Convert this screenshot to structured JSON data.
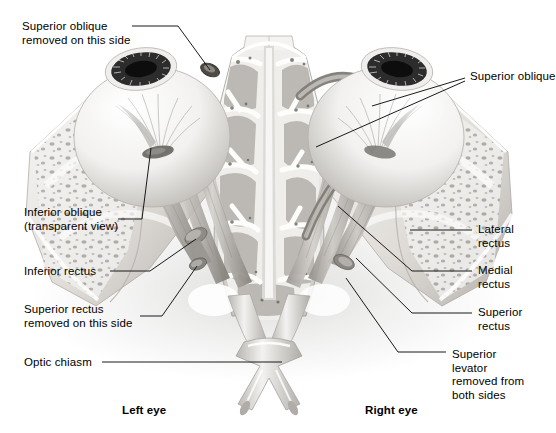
{
  "figure": {
    "background_color": "#ffffff",
    "ink_color": "#000000",
    "leader_color": "#1a1a1a",
    "palette": {
      "bone_light": "#f2f1ef",
      "bone_mid": "#cfcdc9",
      "bone_shadow": "#9e9b96",
      "muscle_light": "#d9d6d1",
      "muscle_mid": "#a9a5a0",
      "muscle_dark": "#6f6c68",
      "sclera": "#f6f5f3",
      "iris": "#3a3a3a",
      "pupil": "#111111",
      "nerve": "#e8e7e4"
    }
  },
  "labels": {
    "superior_oblique_removed": {
      "text": "Superior oblique\nremoved on this side",
      "x": 22,
      "y": 20
    },
    "inferior_oblique": {
      "text": "Inferior oblique\n(transparent view)",
      "x": 24,
      "y": 206
    },
    "inferior_rectus": {
      "text": "Inferior rectus",
      "x": 24,
      "y": 265
    },
    "superior_rectus_removed": {
      "text": "Superior rectus\nremoved on this side",
      "x": 24,
      "y": 303
    },
    "optic_chiasm": {
      "text": "Optic chiasm",
      "x": 24,
      "y": 356
    },
    "superior_oblique": {
      "text": "Superior oblique",
      "x": 470,
      "y": 70
    },
    "lateral_rectus": {
      "text": "Lateral\nrectus",
      "x": 478,
      "y": 223
    },
    "medial_rectus": {
      "text": "Medial\nrectus",
      "x": 478,
      "y": 264
    },
    "superior_rectus": {
      "text": "Superior\nrectus",
      "x": 478,
      "y": 306
    },
    "superior_levator": {
      "text": "Superior\nlevator\nremoved from\nboth sides",
      "x": 452,
      "y": 348
    },
    "left_eye": {
      "text": "Left eye",
      "x": 122,
      "y": 404
    },
    "right_eye": {
      "text": "Right eye",
      "x": 365,
      "y": 404
    }
  },
  "anatomy_parts": [
    "left-eyeball",
    "right-eyeball",
    "left-iris",
    "right-iris",
    "ethmoid-air-cells",
    "nasal-septum",
    "left-lateral-rectus",
    "left-medial-rectus",
    "left-inferior-rectus",
    "left-inferior-oblique",
    "right-superior-oblique",
    "right-lateral-rectus",
    "right-medial-rectus",
    "right-superior-rectus",
    "optic-nerve-left",
    "optic-nerve-right",
    "optic-chiasm",
    "trochlea-stump-left",
    "cut-muscle-stump-left",
    "cut-muscle-stump-right",
    "orbital-bone-left",
    "orbital-bone-right"
  ],
  "leader_lines": [
    {
      "name": "leader-superior-oblique-removed",
      "points": "132,26 178,26 210,70"
    },
    {
      "name": "leader-inferior-oblique",
      "points": "118,219 140,219 150,146"
    },
    {
      "name": "leader-inferior-rectus",
      "points": "110,271 148,271 196,239"
    },
    {
      "name": "leader-superior-rectus-removed",
      "points": "140,316 160,316 196,264"
    },
    {
      "name": "leader-optic-chiasm",
      "points": "102,362 280,362"
    },
    {
      "name": "leader-superior-oblique-a",
      "points": "465,78 372,106"
    },
    {
      "name": "leader-superior-oblique-b",
      "points": "465,80 318,146"
    },
    {
      "name": "leader-lateral-rectus",
      "points": "474,230 412,230"
    },
    {
      "name": "leader-medial-rectus",
      "points": "474,271 412,271 340,206"
    },
    {
      "name": "leader-superior-rectus",
      "points": "474,313 412,313 356,260"
    },
    {
      "name": "leader-superior-levator",
      "points": "448,352 400,352 344,279"
    }
  ]
}
